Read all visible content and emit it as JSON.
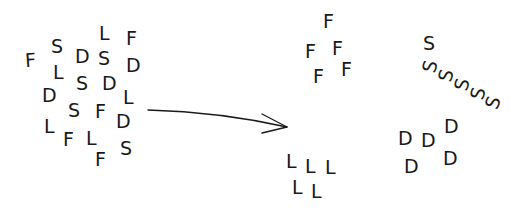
{
  "diagram": {
    "title": "",
    "colors": {
      "ink": "#1a1a1a",
      "background": "#ffffff"
    },
    "mixed_cluster": {
      "letters": [
        {
          "ch": "F",
          "x": 25,
          "y": 51,
          "r": -4
        },
        {
          "ch": "S",
          "x": 51,
          "y": 37,
          "r": 0
        },
        {
          "ch": "D",
          "x": 75,
          "y": 47,
          "r": 0
        },
        {
          "ch": "L",
          "x": 99,
          "y": 24,
          "r": 0
        },
        {
          "ch": "S",
          "x": 98,
          "y": 49,
          "r": 0
        },
        {
          "ch": "F",
          "x": 126,
          "y": 29,
          "r": 0
        },
        {
          "ch": "D",
          "x": 126,
          "y": 56,
          "r": 0
        },
        {
          "ch": "L",
          "x": 53,
          "y": 63,
          "r": 0
        },
        {
          "ch": "S",
          "x": 76,
          "y": 74,
          "r": 0
        },
        {
          "ch": "D",
          "x": 102,
          "y": 74,
          "r": 0
        },
        {
          "ch": "D",
          "x": 42,
          "y": 86,
          "r": 0
        },
        {
          "ch": "L",
          "x": 123,
          "y": 88,
          "r": 0
        },
        {
          "ch": "S",
          "x": 68,
          "y": 101,
          "r": 0
        },
        {
          "ch": "F",
          "x": 95,
          "y": 102,
          "r": 0
        },
        {
          "ch": "D",
          "x": 116,
          "y": 112,
          "r": 0
        },
        {
          "ch": "L",
          "x": 44,
          "y": 117,
          "r": 0
        },
        {
          "ch": "F",
          "x": 63,
          "y": 130,
          "r": 0
        },
        {
          "ch": "L",
          "x": 86,
          "y": 129,
          "r": 0
        },
        {
          "ch": "S",
          "x": 120,
          "y": 139,
          "r": 0
        },
        {
          "ch": "F",
          "x": 95,
          "y": 150,
          "r": 0
        }
      ]
    },
    "arrow": {
      "path": "M 148 110 Q 220 112 287 127",
      "head": "M 262 114 L 287 127 L 262 133",
      "direction": "right"
    },
    "sorted_groups": [
      {
        "name": "F-group",
        "letters": [
          {
            "ch": "F",
            "x": 323,
            "y": 12,
            "r": 0
          },
          {
            "ch": "F",
            "x": 305,
            "y": 42,
            "r": 0
          },
          {
            "ch": "F",
            "x": 332,
            "y": 39,
            "r": 0
          },
          {
            "ch": "F",
            "x": 313,
            "y": 67,
            "r": 0
          },
          {
            "ch": "F",
            "x": 341,
            "y": 60,
            "r": 0
          }
        ]
      },
      {
        "name": "L-group",
        "letters": [
          {
            "ch": "L",
            "x": 286,
            "y": 152,
            "r": 0
          },
          {
            "ch": "L",
            "x": 305,
            "y": 157,
            "r": 0
          },
          {
            "ch": "L",
            "x": 325,
            "y": 158,
            "r": 0
          },
          {
            "ch": "L",
            "x": 292,
            "y": 178,
            "r": 0
          },
          {
            "ch": "L",
            "x": 311,
            "y": 182,
            "r": 0
          }
        ]
      },
      {
        "name": "S-group",
        "letters": [
          {
            "ch": "S",
            "x": 423,
            "y": 34,
            "r": 0
          },
          {
            "ch": "S",
            "x": 424,
            "y": 57,
            "r": -75
          },
          {
            "ch": "S",
            "x": 440,
            "y": 66,
            "r": -75
          },
          {
            "ch": "S",
            "x": 456,
            "y": 75,
            "r": -75
          },
          {
            "ch": "S",
            "x": 472,
            "y": 84,
            "r": -75
          },
          {
            "ch": "S",
            "x": 487,
            "y": 93,
            "r": -70
          }
        ]
      },
      {
        "name": "D-group",
        "letters": [
          {
            "ch": "D",
            "x": 398,
            "y": 129,
            "r": 0
          },
          {
            "ch": "D",
            "x": 421,
            "y": 131,
            "r": 0
          },
          {
            "ch": "D",
            "x": 444,
            "y": 117,
            "r": 0
          },
          {
            "ch": "D",
            "x": 443,
            "y": 149,
            "r": 0
          },
          {
            "ch": "D",
            "x": 404,
            "y": 157,
            "r": 0
          }
        ]
      }
    ]
  }
}
